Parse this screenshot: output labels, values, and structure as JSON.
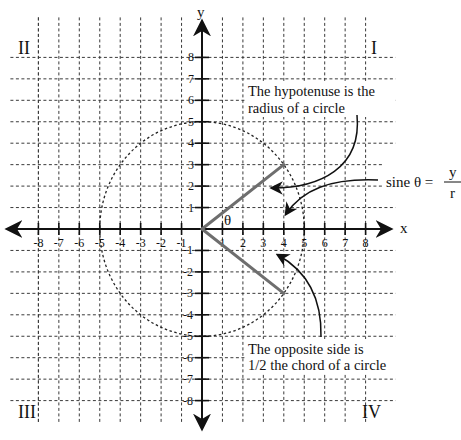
{
  "diagram": {
    "type": "coordinate-plane-trigonometry",
    "x_axis": {
      "label": "x",
      "range": [
        -8,
        8
      ],
      "ticks": [
        -8,
        -7,
        -6,
        -5,
        -4,
        -3,
        -2,
        -1,
        1,
        2,
        3,
        4,
        5,
        6,
        7,
        8
      ]
    },
    "y_axis": {
      "label": "y",
      "range": [
        -8,
        8
      ],
      "ticks": [
        8,
        7,
        6,
        5,
        4,
        3,
        2,
        1,
        -1,
        -2,
        -3,
        -4,
        -5,
        -6,
        -7,
        -8
      ]
    },
    "quadrants": [
      {
        "id": "I",
        "label": "I",
        "position": "top-right"
      },
      {
        "id": "II",
        "label": "II",
        "position": "top-left"
      },
      {
        "id": "III",
        "label": "III",
        "position": "bottom-left"
      },
      {
        "id": "IV",
        "label": "IV",
        "position": "bottom-right"
      }
    ],
    "circle": {
      "center": [
        0,
        0
      ],
      "radius": 5,
      "style": "dashed"
    },
    "segments": [
      {
        "name": "hypotenuse-upper",
        "from": [
          0,
          0
        ],
        "to": [
          4,
          3
        ]
      },
      {
        "name": "hypotenuse-lower",
        "from": [
          0,
          0
        ],
        "to": [
          4,
          -3
        ]
      }
    ],
    "angle_label": "θ",
    "annotations": {
      "hypotenuse": [
        "The hypotenuse is the",
        "radius of a circle"
      ],
      "opposite": [
        "The opposite side is",
        "1/2 the chord of a circle"
      ],
      "formula": {
        "lhs": "sine θ =",
        "numerator": "y",
        "denominator": "r"
      }
    },
    "grid": true
  }
}
